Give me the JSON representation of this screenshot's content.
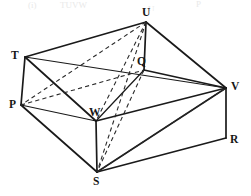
{
  "figure": {
    "type": "3d-solid-diagram",
    "shape": "cuboid",
    "stroke_color": "#1a1a1a",
    "dashed_color": "#2a2a2a",
    "background_color": "#ffffff",
    "header_fragments": [
      {
        "text": "(i)",
        "x": 28,
        "y": 1
      },
      {
        "text": "TUVW",
        "x": 60,
        "y": 1
      },
      {
        "text": "P",
        "x": 196,
        "y": 0
      },
      {
        "text": "U",
        "x": 148,
        "y": 5
      }
    ],
    "vertices": [
      {
        "name": "T",
        "x": 25,
        "y": 57,
        "label": "T",
        "label_x": 11,
        "label_y": 50
      },
      {
        "name": "P",
        "x": 21,
        "y": 105,
        "label": "P",
        "label_x": 9,
        "label_y": 99
      },
      {
        "name": "U",
        "x": 146,
        "y": 22,
        "label": "U",
        "label_x": 142,
        "label_y": 7
      },
      {
        "name": "Q",
        "x": 144,
        "y": 70,
        "label": "Q",
        "label_x": 137,
        "label_y": 56
      },
      {
        "name": "V",
        "x": 226,
        "y": 88,
        "label": "V",
        "label_x": 231,
        "label_y": 81
      },
      {
        "name": "R",
        "x": 226,
        "y": 138,
        "label": "R",
        "label_x": 230,
        "label_y": 134
      },
      {
        "name": "W",
        "x": 96,
        "y": 121,
        "label": "W",
        "label_x": 89,
        "label_y": 107
      },
      {
        "name": "S",
        "x": 97,
        "y": 172,
        "label": "S",
        "label_x": 93,
        "label_y": 176
      }
    ],
    "solid_edges": [
      {
        "from": "T",
        "to": "U",
        "name": "edge-T-U"
      },
      {
        "from": "U",
        "to": "V",
        "name": "edge-U-V"
      },
      {
        "from": "T",
        "to": "P",
        "name": "edge-T-P"
      },
      {
        "from": "P",
        "to": "S",
        "name": "edge-P-S"
      },
      {
        "from": "S",
        "to": "R",
        "name": "edge-S-R"
      },
      {
        "from": "R",
        "to": "V",
        "name": "edge-R-V"
      },
      {
        "from": "U",
        "to": "Q",
        "name": "edge-U-Q"
      },
      {
        "from": "Q",
        "to": "V",
        "name": "edge-Q-V"
      },
      {
        "from": "Q",
        "to": "W",
        "name": "edge-Q-W"
      },
      {
        "from": "W",
        "to": "S",
        "name": "edge-W-S"
      },
      {
        "from": "T",
        "to": "W",
        "name": "edge-T-W"
      },
      {
        "from": "P",
        "to": "W",
        "name": "edge-P-W"
      },
      {
        "from": "W",
        "to": "V",
        "name": "edge-W-V"
      },
      {
        "from": "S",
        "to": "V",
        "name": "edge-S-V-solid"
      },
      {
        "from": "T",
        "to": "V",
        "name": "edge-T-V-upper"
      }
    ],
    "dashed_edges": [
      {
        "from": "U",
        "to": "P",
        "name": "diagonal-U-P"
      },
      {
        "from": "U",
        "to": "S",
        "name": "diagonal-U-S"
      },
      {
        "from": "U",
        "to": "W",
        "name": "diagonal-U-W"
      },
      {
        "from": "Q",
        "to": "S",
        "name": "diagonal-Q-S"
      },
      {
        "from": "S",
        "to": "V",
        "name": "diagonal-S-V"
      },
      {
        "from": "P",
        "to": "Q",
        "name": "diagonal-P-Q"
      }
    ]
  }
}
